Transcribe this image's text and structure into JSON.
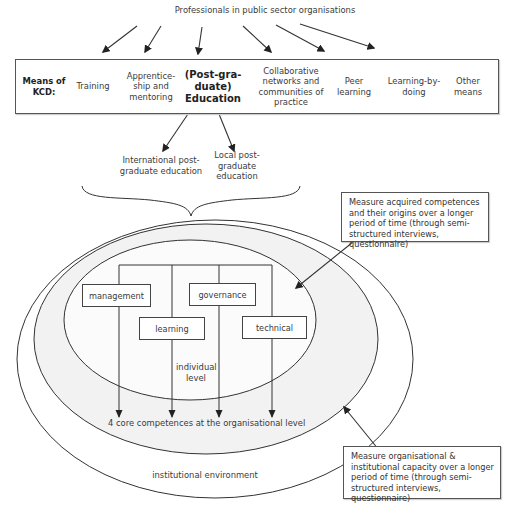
{
  "diagram": {
    "top_label": "Professionals in public sector organisations",
    "kcd_row": {
      "heading": "Means of KCD:",
      "means": [
        {
          "label": "Training"
        },
        {
          "label": "Apprentice-ship and mentoring"
        },
        {
          "label": "(Post-gra-duate) Education",
          "emphasis": true
        },
        {
          "label": "Collaborative networks and communities of practice"
        },
        {
          "label": "Peer learning"
        },
        {
          "label": "Learning-by-doing"
        },
        {
          "label": "Other means"
        }
      ]
    },
    "education_types": [
      {
        "label": "International post-graduate education"
      },
      {
        "label": "Local post-graduate education"
      }
    ],
    "competences": [
      {
        "label": "management"
      },
      {
        "label": "governance"
      },
      {
        "label": "learning"
      },
      {
        "label": "technical"
      }
    ],
    "levels": {
      "individual": "individual level",
      "organisational": "4 core competences at the organisational level",
      "institutional": "institutional environment"
    },
    "notes": {
      "individual_measure": "Measure acquired competences and their origins over a longer period of time (through semi-structured interviews, questionnaire)",
      "organisational_measure": "Measure organisational & institutional capacity over a longer period of time (through semi-structured interviews, questionnaire)"
    },
    "colors": {
      "line": "#333333",
      "organisational_fill": "#f2f2f2",
      "individual_fill": "#fbfbfb",
      "background": "#ffffff"
    }
  }
}
